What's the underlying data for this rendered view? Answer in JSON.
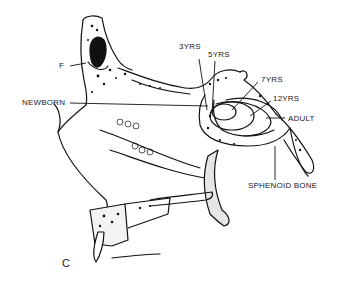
{
  "figure": {
    "panel_letter": "C",
    "labels": {
      "f": "F",
      "newborn": "NEWBORN",
      "y3": "3YRS",
      "y5": "5YRS",
      "y7": "7YRS",
      "y12": "12YRS",
      "adult": "ADULT",
      "sphenoid": "SPHENOID BONE"
    },
    "colors": {
      "ink": "#111111",
      "paper": "#ffffff"
    }
  }
}
